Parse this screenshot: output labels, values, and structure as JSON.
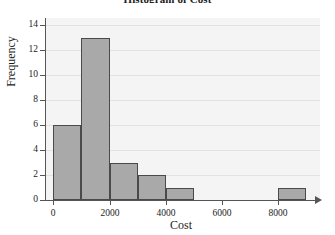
{
  "chart_data": {
    "type": "bar",
    "title": "Histogram of Cost",
    "xlabel": "Cost",
    "ylabel": "Frequency",
    "xlim": [
      -300,
      9500
    ],
    "ylim": [
      0,
      14.6
    ],
    "grid": true,
    "legend": "none",
    "bin_width": 1000,
    "x_ticks": [
      0,
      2000,
      4000,
      6000,
      8000
    ],
    "x_tick_labels": [
      "0",
      "2000",
      "4000",
      "6000",
      "8000"
    ],
    "y_ticks": [
      0,
      2,
      4,
      6,
      8,
      10,
      12,
      14
    ],
    "y_tick_labels": [
      "0",
      "2",
      "4",
      "6",
      "8",
      "10",
      "12",
      "14"
    ],
    "bins": [
      {
        "label": "0-1000",
        "x0": 0,
        "x1": 1000,
        "value": 6
      },
      {
        "label": "1000-2000",
        "x0": 1000,
        "x1": 2000,
        "value": 13
      },
      {
        "label": "2000-3000",
        "x0": 2000,
        "x1": 3000,
        "value": 3
      },
      {
        "label": "3000-4000",
        "x0": 3000,
        "x1": 4000,
        "value": 2
      },
      {
        "label": "4000-5000",
        "x0": 4000,
        "x1": 5000,
        "value": 1
      },
      {
        "label": "8000-9000",
        "x0": 8000,
        "x1": 9000,
        "value": 1
      }
    ],
    "categories": [
      "0-1000",
      "1000-2000",
      "2000-3000",
      "3000-4000",
      "4000-5000",
      "8000-9000"
    ],
    "values": [
      6,
      13,
      3,
      2,
      1,
      1
    ],
    "colors": {
      "bar_fill": "#a9a9a9",
      "bar_edge": "#4a4a4a",
      "plot_background": "#f4f4f4",
      "gridline": "#e2e2e2",
      "axis": "#555555",
      "text": "#1c1c1c",
      "page_background": "#ffffff"
    }
  }
}
